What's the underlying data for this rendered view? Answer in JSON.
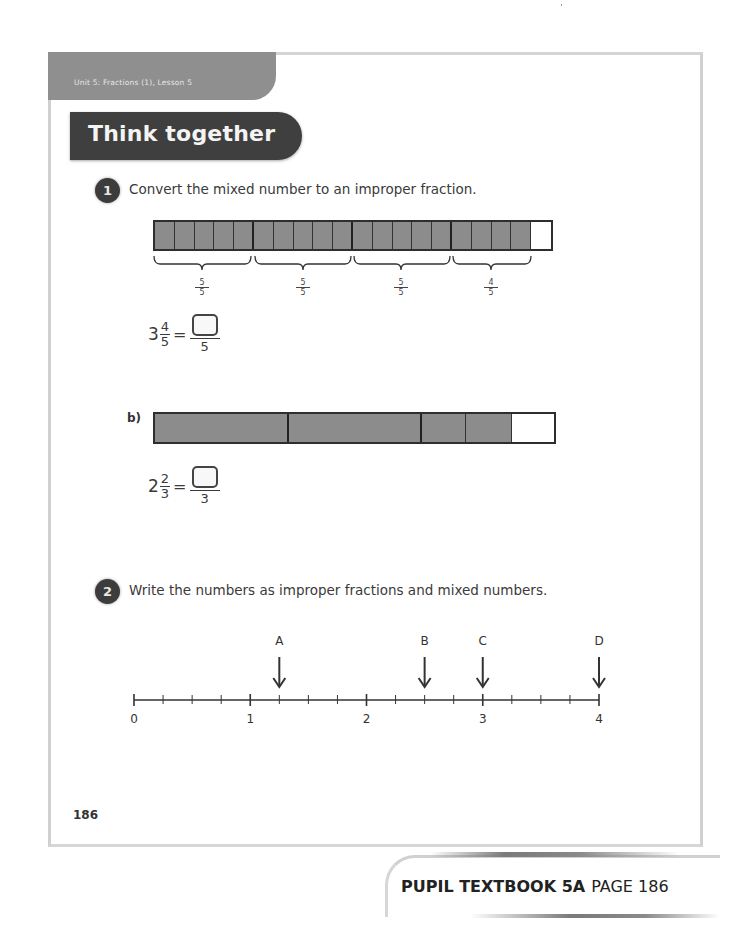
{
  "header": {
    "unit_tab": "Unit 5: Fractions (1), Lesson 5",
    "banner_title": "Think together"
  },
  "question1": {
    "number": "1",
    "prompt": "Convert the mixed number to an improper fraction.",
    "part_a": {
      "bar_model": {
        "total_cells": 20,
        "shaded_cells": 19,
        "group_size": 5,
        "braces": [
          {
            "numerator": "5",
            "denominator": "5"
          },
          {
            "numerator": "5",
            "denominator": "5"
          },
          {
            "numerator": "5",
            "denominator": "5"
          },
          {
            "numerator": "4",
            "denominator": "5"
          }
        ]
      },
      "equation": {
        "whole": "3",
        "numerator": "4",
        "denominator": "5",
        "equals": "=",
        "answer_numerator": "",
        "answer_denominator": "5"
      }
    },
    "part_b": {
      "label": "b)",
      "bar_model": {
        "cells": [
          {
            "size": "whole",
            "shaded": true
          },
          {
            "size": "whole",
            "shaded": true
          },
          {
            "size": "third",
            "shaded": true
          },
          {
            "size": "third",
            "shaded": true
          },
          {
            "size": "third",
            "shaded": false
          }
        ]
      },
      "equation": {
        "whole": "2",
        "numerator": "2",
        "denominator": "3",
        "equals": "=",
        "answer_numerator": "",
        "answer_denominator": "3"
      }
    }
  },
  "question2": {
    "number": "2",
    "prompt": "Write the numbers as improper fractions and mixed numbers.",
    "number_line": {
      "start": 0,
      "end": 4,
      "subdivisions_per_whole": 4,
      "tick_labels": [
        "0",
        "1",
        "2",
        "3",
        "4"
      ],
      "markers": [
        {
          "label": "A",
          "value": 1.25
        },
        {
          "label": "B",
          "value": 2.5
        },
        {
          "label": "C",
          "value": 3
        },
        {
          "label": "D",
          "value": 4
        }
      ]
    }
  },
  "footer": {
    "page_number": "186",
    "book_label": "PUPIL TEXTBOOK 5A",
    "page_label": "PAGE 186"
  },
  "colors": {
    "shaded": "#8c8c8c",
    "banner": "#3f3f3f",
    "unit_tab": "#8f8f8f",
    "outline": "#2e2e2e"
  }
}
